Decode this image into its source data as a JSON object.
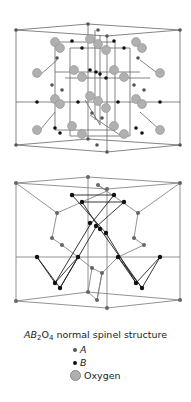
{
  "caption": {
    "prefix_A": "A",
    "prefix_B": "B",
    "sub2": "2",
    "prefix_O": "O",
    "sub4": "4",
    "text": " normal spinel structure"
  },
  "legend": [
    {
      "label": "A",
      "italic": true,
      "color": "#555555",
      "size": 4
    },
    {
      "label": "B",
      "italic": true,
      "color": "#111111",
      "size": 4
    },
    {
      "label": "Oxygen",
      "italic": false,
      "color": "#aaaaaa",
      "size": 9
    }
  ],
  "colors": {
    "edge": "#666666",
    "oxygen": "#b0b0b0",
    "a_site": "#555555",
    "b_site": "#111111"
  }
}
